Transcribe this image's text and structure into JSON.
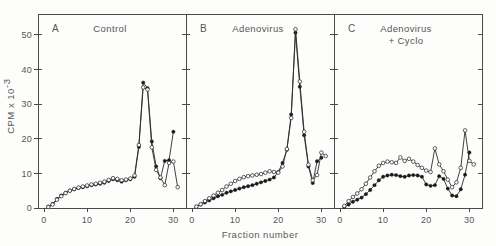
{
  "figure": {
    "xlabel": "Fraction number",
    "ylabel_main": "CPM x 10",
    "ylabel_exponent": "-3",
    "background_color": "#fdfdfc",
    "line_color": "#2b2b2b"
  },
  "chart_data": {
    "type": "line",
    "title": "",
    "xlabel": "Fraction number",
    "ylabel": "CPM x 10^-3",
    "xlim": [
      0,
      32
    ],
    "ylim": [
      0,
      56
    ],
    "xticks": [
      0,
      10,
      20,
      30
    ],
    "yticks": [
      0,
      10,
      20,
      30,
      40,
      50
    ],
    "grid": false,
    "legend": "none",
    "panels": [
      {
        "letter": "A",
        "title": "Control",
        "title_line2": "",
        "series": [
          {
            "name": "filled-circles",
            "marker": "filled",
            "x": [
              1,
              2,
              3,
              4,
              5,
              6,
              7,
              8,
              9,
              10,
              11,
              12,
              13,
              14,
              15,
              16,
              17,
              18,
              19,
              20,
              21,
              22,
              23,
              24,
              25,
              26,
              27,
              28,
              29,
              30
            ],
            "values": [
              0.4,
              1.2,
              2.6,
              3.6,
              4.4,
              5.0,
              5.4,
              5.8,
              6.0,
              6.3,
              6.6,
              6.8,
              7.0,
              7.3,
              7.8,
              8.3,
              8.0,
              7.6,
              8.0,
              8.3,
              9.0,
              17.6,
              36.2,
              34.6,
              19.2,
              12.0,
              8.6,
              13.6,
              13.8,
              22.0
            ]
          },
          {
            "name": "open-circles",
            "marker": "open",
            "x": [
              1,
              2,
              3,
              4,
              5,
              6,
              7,
              8,
              9,
              10,
              11,
              12,
              13,
              14,
              15,
              16,
              17,
              18,
              19,
              20,
              21,
              22,
              23,
              24,
              25,
              26,
              27,
              28,
              29,
              30,
              31
            ],
            "values": [
              0.3,
              1.0,
              2.4,
              3.4,
              4.3,
              5.0,
              5.5,
              5.9,
              6.2,
              6.5,
              6.8,
              7.0,
              7.3,
              7.6,
              8.1,
              8.6,
              8.4,
              8.0,
              8.2,
              8.5,
              9.4,
              18.2,
              34.8,
              34.2,
              17.5,
              11.0,
              8.8,
              6.6,
              13.0,
              13.4,
              6.0
            ]
          }
        ]
      },
      {
        "letter": "B",
        "title": "Adenovirus",
        "title_line2": "",
        "series": [
          {
            "name": "filled-circles",
            "marker": "filled",
            "x": [
              1,
              2,
              3,
              4,
              5,
              6,
              7,
              8,
              9,
              10,
              11,
              12,
              13,
              14,
              15,
              16,
              17,
              18,
              19,
              20,
              21,
              22,
              23,
              24,
              25,
              26,
              27,
              28,
              29,
              30
            ],
            "values": [
              0.4,
              1.0,
              1.6,
              2.2,
              2.8,
              3.4,
              3.8,
              4.4,
              4.8,
              5.2,
              5.6,
              6.0,
              6.3,
              6.6,
              7.0,
              7.4,
              7.8,
              8.2,
              8.8,
              10.4,
              13.0,
              16.8,
              27.0,
              50.6,
              35.0,
              21.0,
              12.0,
              7.2,
              13.5,
              14.5
            ]
          },
          {
            "name": "open-circles",
            "marker": "open",
            "x": [
              1,
              2,
              3,
              4,
              5,
              6,
              7,
              8,
              9,
              10,
              11,
              12,
              13,
              14,
              15,
              16,
              17,
              18,
              19,
              20,
              21,
              22,
              23,
              24,
              25,
              26,
              27,
              28,
              29,
              30,
              31
            ],
            "values": [
              0.4,
              1.1,
              2.0,
              2.8,
              3.6,
              4.4,
              5.2,
              6.2,
              7.0,
              7.8,
              8.4,
              8.9,
              9.2,
              9.4,
              9.6,
              9.8,
              10.2,
              10.6,
              10.4,
              10.2,
              12.0,
              17.0,
              26.0,
              51.6,
              36.5,
              22.0,
              12.5,
              8.0,
              9.5,
              16.0,
              15.0
            ]
          }
        ]
      },
      {
        "letter": "C",
        "title": "Adenovirus",
        "title_line2": "+ Cyclo",
        "series": [
          {
            "name": "filled-circles",
            "marker": "filled",
            "x": [
              1,
              2,
              3,
              4,
              5,
              6,
              7,
              8,
              9,
              10,
              11,
              12,
              13,
              14,
              15,
              16,
              17,
              18,
              19,
              20,
              21,
              22,
              23,
              24,
              25,
              26,
              27,
              28,
              29,
              30
            ],
            "values": [
              0.3,
              1.0,
              1.8,
              2.4,
              3.0,
              4.0,
              5.2,
              6.6,
              8.0,
              9.0,
              9.4,
              9.6,
              9.5,
              9.2,
              9.0,
              9.4,
              9.5,
              9.4,
              9.0,
              6.8,
              6.4,
              6.6,
              9.2,
              8.4,
              5.6,
              3.6,
              3.4,
              5.4,
              9.6,
              16.0
            ]
          },
          {
            "name": "open-circles",
            "marker": "open",
            "x": [
              1,
              2,
              3,
              4,
              5,
              6,
              7,
              8,
              9,
              10,
              11,
              12,
              13,
              14,
              15,
              16,
              17,
              18,
              19,
              20,
              21,
              22,
              23,
              24,
              25,
              26,
              27,
              28,
              29,
              30,
              31
            ],
            "values": [
              0.6,
              2.0,
              3.2,
              4.2,
              5.4,
              7.0,
              8.8,
              10.6,
              12.2,
              13.0,
              13.4,
              13.2,
              13.0,
              14.6,
              13.6,
              14.2,
              13.4,
              12.4,
              11.6,
              10.8,
              10.4,
              17.2,
              12.6,
              10.6,
              8.2,
              6.0,
              7.4,
              11.6,
              22.4,
              13.6,
              12.6
            ]
          }
        ]
      }
    ]
  }
}
